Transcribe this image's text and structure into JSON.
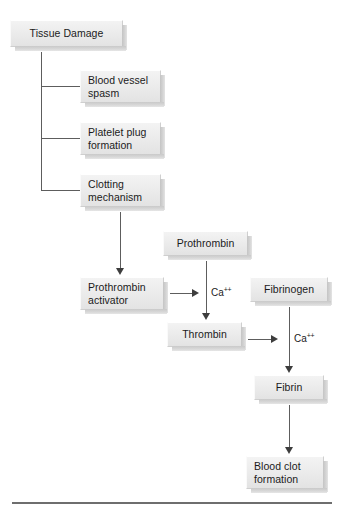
{
  "figure": {
    "type": "flowchart",
    "orientation": "top-down"
  },
  "nodes": {
    "tissue_damage": "Tissue Damage",
    "blood_vessel_spasm": "Blood vessel\nspasm",
    "blood_vessel_spasm_l1": "Blood vessel",
    "blood_vessel_spasm_l2": "spasm",
    "platelet_plug_l1": "Platelet plug",
    "platelet_plug_l2": "formation",
    "clotting_mechanism_l1": "Clotting",
    "clotting_mechanism_l2": "mechanism",
    "prothrombin_activator_l1": "Prothrombin",
    "prothrombin_activator_l2": "activator",
    "prothrombin": "Prothrombin",
    "thrombin": "Thrombin",
    "fibrinogen": "Fibrinogen",
    "fibrin": "Fibrin",
    "blood_clot_l1": "Blood clot",
    "blood_clot_l2": "formation"
  },
  "labels": {
    "calcium_1_symbol": "Ca",
    "calcium_1_charge": "++",
    "calcium_2_symbol": "Ca",
    "calcium_2_charge": "++"
  },
  "colors": {
    "box_fill_top": "#f3f3f3",
    "box_fill_bottom": "#e3e3e3",
    "box_border": "#cfcfcf",
    "box_shadow": "#c9c9c9",
    "connector": "#5d5d5d",
    "arrowhead": "#3d3d3d",
    "text": "#1b1b1b",
    "rule": "#6e6e6e",
    "background": "#ffffff"
  }
}
